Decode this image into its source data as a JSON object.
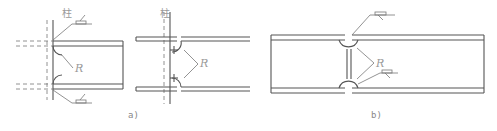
{
  "figure": {
    "panels": [
      {
        "id": "a-left",
        "column_label": "柱",
        "radius_label": "R"
      },
      {
        "id": "a-right",
        "column_label": "柱",
        "radius_label": "R"
      },
      {
        "id": "b",
        "radius_label": "R"
      }
    ],
    "captions": {
      "a": "a)",
      "b": "b)"
    },
    "colors": {
      "line": "#555555",
      "label": "#999999",
      "background": "#ffffff"
    }
  }
}
